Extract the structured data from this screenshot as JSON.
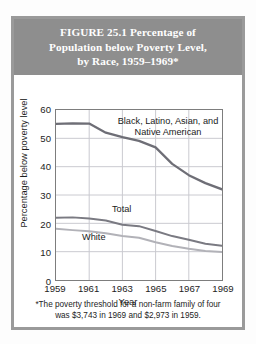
{
  "figure": {
    "title": "FIGURE 25.1   Percentage of Population below Poverty Level, by Race, 1959–1969*",
    "title_lines": [
      "FIGURE 25.1   Percentage of",
      "Population below Poverty Level,",
      "by Race, 1959–1969*"
    ],
    "footnote": "*The poverty threshold for a non-farm family of four was  $3,743 in 1969 and $2,973 in 1959.",
    "footnote_lines": [
      "*The poverty threshold for a non-farm family of four",
      "was  $3,743 in 1969 and $2,973 in 1959."
    ],
    "title_band_color": "#8e8e8e",
    "title_text_color": "#ffffff",
    "border_color": "#9a9a9a",
    "background_color": "#ffffff"
  },
  "chart_data": {
    "type": "line",
    "title": "Percentage of Population below Poverty Level, by Race, 1959–1969",
    "xlabel": "Year",
    "ylabel": "Percentage below poverty level",
    "x": [
      1959,
      1960,
      1961,
      1962,
      1963,
      1964,
      1965,
      1966,
      1967,
      1968,
      1969
    ],
    "xticks": [
      "1959",
      "1961",
      "1963",
      "1965",
      "1967",
      "1969"
    ],
    "xtick_values": [
      1959,
      1961,
      1963,
      1965,
      1967,
      1969
    ],
    "xlim": [
      1959,
      1969
    ],
    "yticks": [
      "0",
      "10",
      "20",
      "30",
      "40",
      "50",
      "60"
    ],
    "ytick_values": [
      0,
      10,
      20,
      30,
      40,
      50,
      60
    ],
    "ylim": [
      0,
      60
    ],
    "grid": true,
    "grid_color": "#c9c9cf",
    "legend_position": "inline-annotations",
    "series": [
      {
        "name": "Black, Latino, Asian, and Native American",
        "label_lines": [
          "Black, Latino, Asian, and",
          "Native American"
        ],
        "color": "#6e6e76",
        "width": 2.3,
        "values": [
          55.1,
          55.3,
          55.2,
          52.0,
          50.4,
          49.1,
          46.8,
          41.0,
          37.0,
          34.2,
          32.0
        ]
      },
      {
        "name": "Total",
        "label_lines": [
          "Total"
        ],
        "color": "#7a7a82",
        "width": 2.0,
        "values": [
          22.0,
          22.1,
          21.7,
          21.0,
          19.5,
          19.0,
          17.3,
          15.5,
          14.2,
          12.8,
          12.1
        ]
      },
      {
        "name": "White",
        "label_lines": [
          "White"
        ],
        "color": "#b2b2b8",
        "width": 2.0,
        "values": [
          18.1,
          17.6,
          17.2,
          16.5,
          15.5,
          14.9,
          13.3,
          12.0,
          11.0,
          10.2,
          9.9
        ]
      }
    ]
  }
}
